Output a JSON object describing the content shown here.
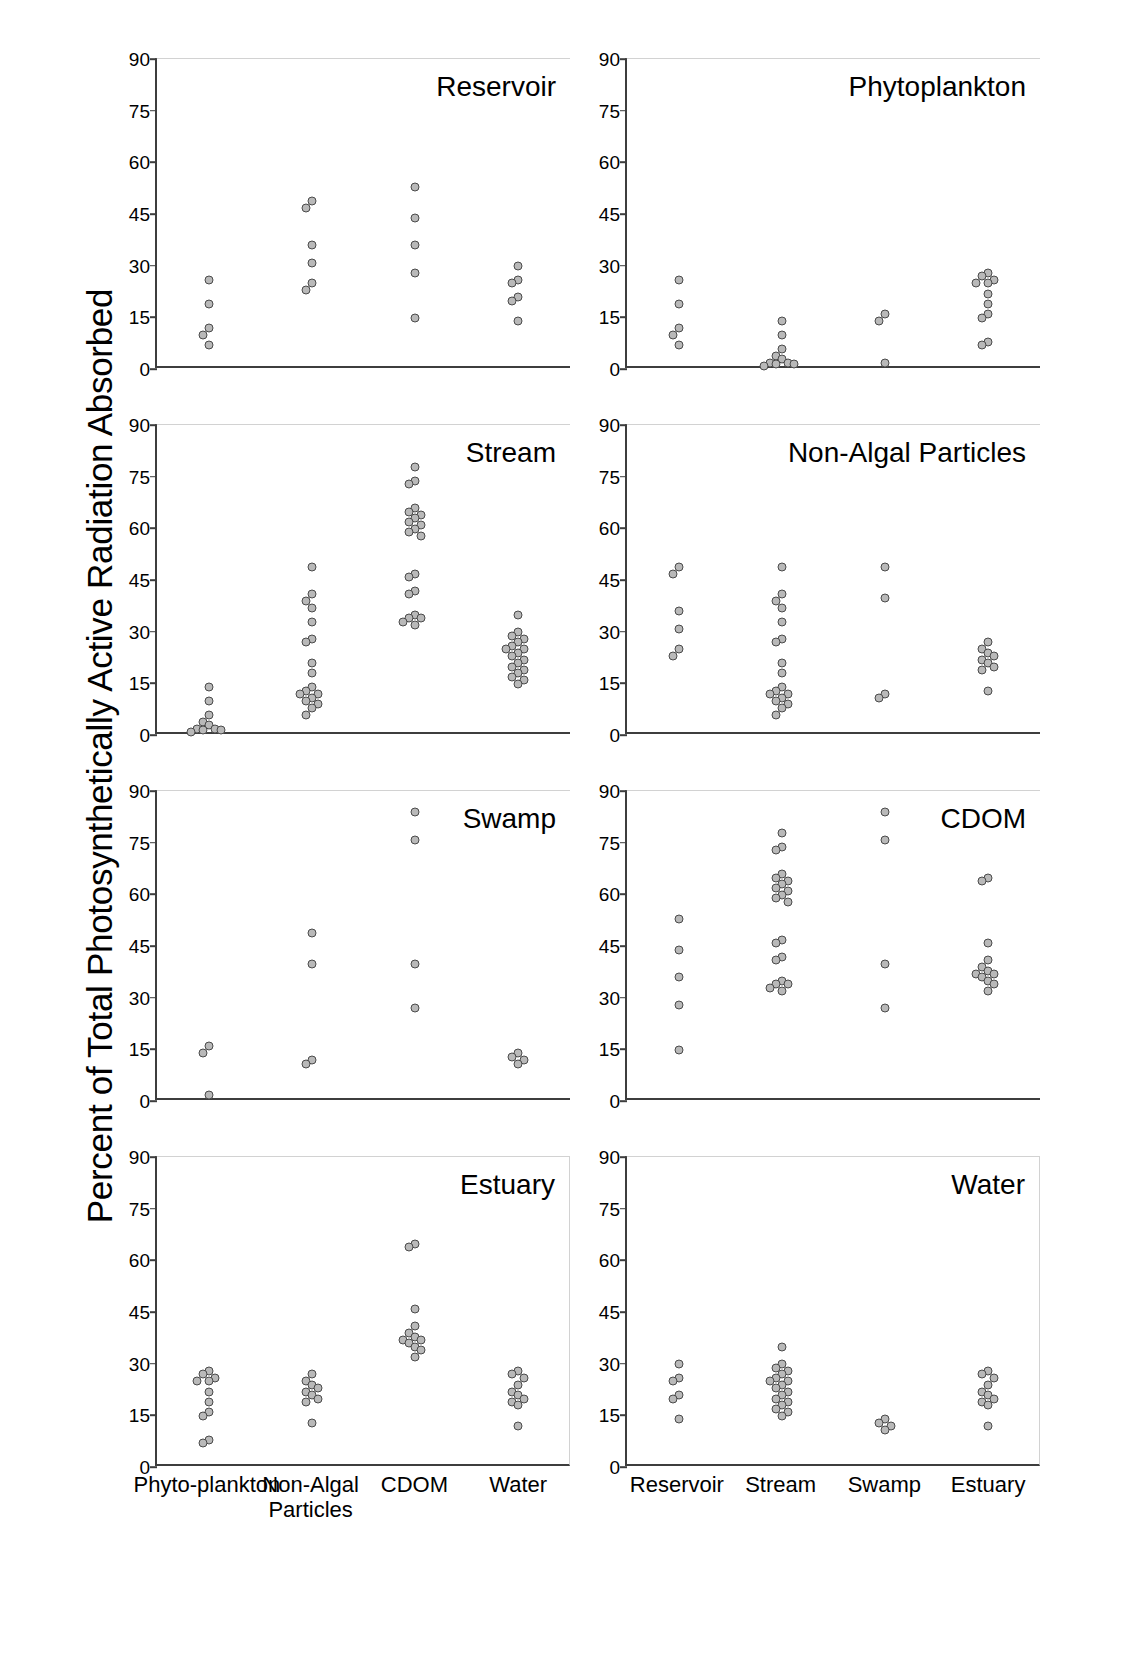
{
  "figure": {
    "ylabel": "Percent of Total Photosynthetically Active Radiation Absorbed"
  },
  "chart_data": {
    "type": "scatter",
    "title": "",
    "xlabel": "",
    "ylabel": "Percent of Total Photosynthetically Active Radiation Absorbed",
    "ylim": [
      0,
      90
    ],
    "yticks": [
      0,
      15,
      30,
      45,
      60,
      75,
      90
    ],
    "grid": false,
    "legend": "none",
    "layout": "4 rows x 2 columns of strip (dot) plots",
    "panels": [
      {
        "title": "Reservoir",
        "row": 1,
        "col": 1,
        "categories": [
          "Phyto-plankton",
          "Non-Algal Particles",
          "CDOM",
          "Water"
        ],
        "series": [
          {
            "name": "Phyto-plankton",
            "values": [
              25,
              18,
              11,
              9,
              6
            ]
          },
          {
            "name": "Non-Algal Particles",
            "values": [
              48,
              46,
              35,
              30,
              24,
              22
            ]
          },
          {
            "name": "CDOM",
            "values": [
              52,
              43,
              35,
              27,
              14
            ]
          },
          {
            "name": "Water",
            "values": [
              29,
              25,
              24,
              20,
              19,
              13
            ]
          }
        ]
      },
      {
        "title": "Phytoplankton",
        "row": 1,
        "col": 2,
        "categories": [
          "Reservoir",
          "Stream",
          "Swamp",
          "Estuary"
        ],
        "series": [
          {
            "name": "Reservoir",
            "values": [
              25,
              18,
              11,
              9,
              6
            ]
          },
          {
            "name": "Stream",
            "values": [
              13,
              9,
              5,
              3,
              2,
              1,
              1,
              0.5,
              0.5,
              0
            ]
          },
          {
            "name": "Swamp",
            "values": [
              15,
              13,
              1
            ]
          },
          {
            "name": "Estuary",
            "values": [
              27,
              26,
              25,
              24,
              24,
              21,
              18,
              15,
              14,
              7,
              6
            ]
          }
        ]
      },
      {
        "title": "Stream",
        "row": 2,
        "col": 1,
        "categories": [
          "Phyto-plankton",
          "Non-Algal Particles",
          "CDOM",
          "Water"
        ],
        "series": [
          {
            "name": "Phyto-plankton",
            "values": [
              13,
              9,
              5,
              3,
              2,
              1,
              1,
              0.5,
              0.5,
              0
            ]
          },
          {
            "name": "Non-Algal Particles",
            "values": [
              48,
              40,
              38,
              36,
              32,
              27,
              26,
              20,
              17,
              13,
              12,
              11,
              11,
              10,
              9,
              8,
              7,
              5
            ]
          },
          {
            "name": "CDOM",
            "values": [
              77,
              73,
              72,
              65,
              64,
              63,
              62,
              61,
              60,
              59,
              58,
              57,
              46,
              45,
              41,
              40,
              34,
              33,
              33,
              32,
              31
            ]
          },
          {
            "name": "Water",
            "values": [
              34,
              29,
              28,
              27,
              26,
              25,
              24,
              24,
              23,
              22,
              21,
              20,
              19,
              18,
              17,
              16,
              15,
              14
            ]
          }
        ]
      },
      {
        "title": "Non-Algal Particles",
        "row": 2,
        "col": 2,
        "categories": [
          "Reservoir",
          "Stream",
          "Swamp",
          "Estuary"
        ],
        "series": [
          {
            "name": "Reservoir",
            "values": [
              48,
              46,
              35,
              30,
              24,
              22
            ]
          },
          {
            "name": "Stream",
            "values": [
              48,
              40,
              38,
              36,
              32,
              27,
              26,
              20,
              17,
              13,
              12,
              11,
              11,
              10,
              9,
              8,
              7,
              5
            ]
          },
          {
            "name": "Swamp",
            "values": [
              48,
              39,
              11,
              10
            ]
          },
          {
            "name": "Estuary",
            "values": [
              26,
              24,
              23,
              22,
              21,
              20,
              19,
              18,
              12
            ]
          }
        ]
      },
      {
        "title": "Swamp",
        "row": 3,
        "col": 1,
        "categories": [
          "Phyto-plankton",
          "Non-Algal Particles",
          "CDOM",
          "Water"
        ],
        "series": [
          {
            "name": "Phyto-plankton",
            "values": [
              15,
              13,
              1
            ]
          },
          {
            "name": "Non-Algal Particles",
            "values": [
              48,
              39,
              11,
              10
            ]
          },
          {
            "name": "CDOM",
            "values": [
              83,
              75,
              39,
              26
            ]
          },
          {
            "name": "Water",
            "values": [
              13,
              12,
              11,
              10
            ]
          }
        ]
      },
      {
        "title": "CDOM",
        "row": 3,
        "col": 2,
        "categories": [
          "Reservoir",
          "Stream",
          "Swamp",
          "Estuary"
        ],
        "series": [
          {
            "name": "Reservoir",
            "values": [
              52,
              43,
              35,
              27,
              14
            ]
          },
          {
            "name": "Stream",
            "values": [
              77,
              73,
              72,
              65,
              64,
              63,
              62,
              61,
              60,
              59,
              58,
              57,
              46,
              45,
              41,
              40,
              34,
              33,
              33,
              32,
              31
            ]
          },
          {
            "name": "Swamp",
            "values": [
              83,
              75,
              39,
              26
            ]
          },
          {
            "name": "Estuary",
            "values": [
              64,
              63,
              45,
              40,
              38,
              37,
              36,
              36,
              35,
              34,
              33,
              31
            ]
          }
        ]
      },
      {
        "title": "Estuary",
        "row": 4,
        "col": 1,
        "categories": [
          "Phyto-plankton",
          "Non-Algal Particles",
          "CDOM",
          "Water"
        ],
        "series": [
          {
            "name": "Phyto-plankton",
            "values": [
              27,
              26,
              25,
              24,
              24,
              21,
              18,
              15,
              14,
              7,
              6
            ]
          },
          {
            "name": "Non-Algal Particles",
            "values": [
              26,
              24,
              23,
              22,
              21,
              20,
              19,
              18,
              12
            ]
          },
          {
            "name": "CDOM",
            "values": [
              64,
              63,
              45,
              40,
              38,
              37,
              36,
              36,
              35,
              34,
              33,
              31
            ]
          },
          {
            "name": "Water",
            "values": [
              27,
              26,
              25,
              23,
              21,
              20,
              19,
              18,
              17,
              11
            ]
          }
        ]
      },
      {
        "title": "Water",
        "row": 4,
        "col": 2,
        "categories": [
          "Reservoir",
          "Stream",
          "Swamp",
          "Estuary"
        ],
        "series": [
          {
            "name": "Reservoir",
            "values": [
              29,
              25,
              24,
              20,
              19,
              13
            ]
          },
          {
            "name": "Stream",
            "values": [
              34,
              29,
              28,
              27,
              26,
              25,
              24,
              24,
              23,
              22,
              21,
              20,
              19,
              18,
              17,
              16,
              15,
              14
            ]
          },
          {
            "name": "Swamp",
            "values": [
              13,
              12,
              11,
              10
            ]
          },
          {
            "name": "Estuary",
            "values": [
              27,
              26,
              25,
              23,
              21,
              20,
              19,
              18,
              17,
              11
            ]
          }
        ]
      }
    ]
  }
}
